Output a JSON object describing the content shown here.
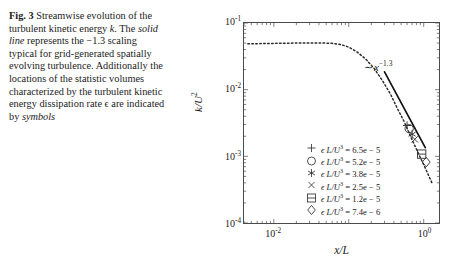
{
  "caption": {
    "label": "Fig. 3",
    "text_runs": [
      {
        "t": "Streamwise evolution of the turbulent kinetic energy ",
        "style": "normal"
      },
      {
        "t": "k",
        "style": "italic"
      },
      {
        "t": ". The ",
        "style": "normal"
      },
      {
        "t": "solid line",
        "style": "italic"
      },
      {
        "t": " represents the −1.3 scaling typical for grid-generated spatially evolving turbulence. Additionally the locations of the statistic volumes characterized by the turbulent kinetic energy dissipation rate ϵ are indicated by ",
        "style": "normal"
      },
      {
        "t": "symbols",
        "style": "italic"
      }
    ],
    "full_text": "Fig. 3 Streamwise evolution of the turbulent kinetic energy k. The solid line represents the −1.3 scaling typical for grid-generated spatially evolving turbulence. Additionally the locations of the statistic volumes characterized by the turbulent kinetic energy dissipation rate ϵ are indicated by symbols"
  },
  "chart_data": {
    "type": "line",
    "title": "",
    "xlabel": "x/L",
    "ylabel": "k/U²",
    "xscale": "log",
    "yscale": "log",
    "xlim": [
      0.004,
      1.6
    ],
    "ylim": [
      0.0001,
      0.1
    ],
    "xticks": [
      {
        "value": 0.01,
        "label": "10",
        "exponent": "-2"
      },
      {
        "value": 1.0,
        "label": "10",
        "exponent": "0"
      }
    ],
    "yticks": [
      {
        "value": 0.1,
        "label": "10",
        "exponent": "-1"
      },
      {
        "value": 0.01,
        "label": "10",
        "exponent": "-2"
      },
      {
        "value": 0.001,
        "label": "10",
        "exponent": "-3"
      },
      {
        "value": 0.0001,
        "label": "10",
        "exponent": "-4"
      }
    ],
    "grid": false,
    "legend_position": "lower-left-inside",
    "series": [
      {
        "name": "k/U^2 streamwise decay",
        "style": "dotted",
        "color": "#2b2b2b",
        "x": [
          0.0045,
          0.006,
          0.008,
          0.011,
          0.015,
          0.02,
          0.027,
          0.035,
          0.045,
          0.06,
          0.08,
          0.1,
          0.13,
          0.17,
          0.22,
          0.28,
          0.36,
          0.45,
          0.55,
          0.68,
          0.8,
          0.9,
          1.0,
          1.15,
          1.3
        ],
        "y": [
          0.049,
          0.049,
          0.0492,
          0.0495,
          0.0498,
          0.05,
          0.0502,
          0.0503,
          0.0502,
          0.0495,
          0.0472,
          0.0435,
          0.0365,
          0.0285,
          0.0205,
          0.0138,
          0.0086,
          0.0051,
          0.0033,
          0.0019,
          0.00128,
          0.00096,
          0.00075,
          0.00053,
          0.00039
        ]
      },
      {
        "name": "-1.3 scaling reference",
        "style": "solid",
        "color": "#111111",
        "label": "~ x^-1.3",
        "exponent": -1.3,
        "x": [
          0.3,
          1.05
        ],
        "y": [
          0.0185,
          0.00135
        ]
      }
    ],
    "annotations": [
      {
        "text": "∼ x",
        "superscript": "−1.3",
        "x": 0.34,
        "y": 0.03
      }
    ],
    "markers": [
      {
        "symbol": "plus",
        "epsilon_label": "6.5e − 5",
        "epsilon_value": 6.5e-05,
        "x": 0.6,
        "y": 0.0029
      },
      {
        "symbol": "circle",
        "epsilon_label": "5.2e − 5",
        "epsilon_value": 5.2e-05,
        "x": 0.64,
        "y": 0.0026
      },
      {
        "symbol": "asterisk",
        "epsilon_label": "3.8e − 5",
        "epsilon_value": 3.8e-05,
        "x": 0.7,
        "y": 0.00215
      },
      {
        "symbol": "cross",
        "epsilon_label": "2.5e − 5",
        "epsilon_value": 2.5e-05,
        "x": 0.76,
        "y": 0.0018
      },
      {
        "symbol": "square",
        "epsilon_label": "1.2e − 5",
        "epsilon_value": 1.2e-05,
        "x": 0.94,
        "y": 0.00108
      },
      {
        "symbol": "diamond",
        "epsilon_label": "7.4e − 6",
        "epsilon_value": 7.4e-06,
        "x": 1.08,
        "y": 0.00082
      }
    ],
    "legend_entries": [
      {
        "symbol": "plus",
        "prefix": "ϵ L/U",
        "sup": "3",
        "equals": "=",
        "value": "6.5e − 5"
      },
      {
        "symbol": "circle",
        "prefix": "ϵ L/U",
        "sup": "3",
        "equals": "=",
        "value": "5.2e − 5"
      },
      {
        "symbol": "asterisk",
        "prefix": "ϵ L/U",
        "sup": "3",
        "equals": "=",
        "value": "3.8e − 5"
      },
      {
        "symbol": "cross",
        "prefix": "ϵ L/U",
        "sup": "3",
        "equals": "=",
        "value": "2.5e − 5"
      },
      {
        "symbol": "square",
        "prefix": "ϵ L/U",
        "sup": "3",
        "equals": "=",
        "value": "1.2e − 5"
      },
      {
        "symbol": "diamond",
        "prefix": "ϵ L/U",
        "sup": "3",
        "equals": "=",
        "value": "7.4e − 6"
      }
    ]
  },
  "colors": {
    "background": "#ffffff",
    "axis": "#4a4a4a",
    "text": "#1a1a1a",
    "curve": "#2b2b2b",
    "reference_line": "#111111"
  }
}
